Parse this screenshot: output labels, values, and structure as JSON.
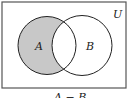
{
  "diagram": {
    "type": "venn",
    "universe_label": "U",
    "sets": [
      {
        "label": "A",
        "shaded_region": "only A (A minus B)"
      },
      {
        "label": "B"
      }
    ],
    "shading_color": "#c8c8c8",
    "stroke_color": "#222222",
    "caption": "A − B"
  }
}
